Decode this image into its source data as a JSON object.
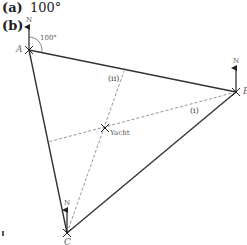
{
  "parts": {
    "a": {
      "label": "(a)",
      "answer": "100°"
    },
    "b": {
      "label": "(b)"
    }
  },
  "diagram": {
    "points": {
      "A": {
        "label": "A",
        "x": 29,
        "y": 50
      },
      "B": {
        "label": "B",
        "x": 236,
        "y": 92
      },
      "C": {
        "label": "C",
        "x": 67,
        "y": 233
      },
      "Yacht": {
        "label": "Yacht",
        "x": 105,
        "y": 128
      }
    },
    "north_label": "N",
    "angle_label": "100°",
    "bearing_lines": [
      {
        "label": "(i)",
        "from": "B",
        "through": "Yacht"
      },
      {
        "label": "(ii)",
        "from": "C",
        "through": "Yacht"
      }
    ],
    "colors": {
      "solid_line": "#333333",
      "dashed_line": "#888888",
      "text": "#222222"
    }
  }
}
